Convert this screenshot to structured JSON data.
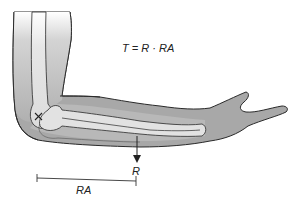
{
  "diagram": {
    "type": "anatomical-lever",
    "equation": "T = R · RA",
    "labels": {
      "force": "R",
      "resistance_arm": "RA"
    },
    "markers": {
      "pivot": "X at elbow joint (axis of rotation)"
    },
    "colors": {
      "skin_dark": "#9a9a9a",
      "skin_mid": "#b8b8b8",
      "bone": "#e2e2e2",
      "upper_arm_light": "#d8d8d8",
      "outline": "#2a2a2a",
      "text": "#222222"
    }
  }
}
